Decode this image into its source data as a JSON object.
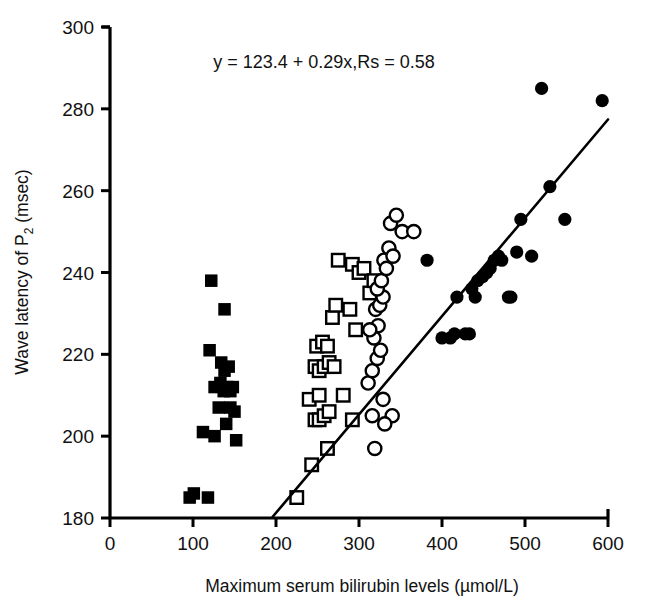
{
  "chart_data": {
    "type": "scatter",
    "title": "",
    "xlabel": "Maximum serum bilirubin levels (µmol/L)",
    "ylabel": "Wave latency of P₂ (msec)",
    "ylabel_main": "Wave latency of P",
    "ylabel_sub": "2",
    "ylabel_tail": " (msec)",
    "xlim": [
      0,
      600
    ],
    "ylim": [
      180,
      300
    ],
    "xticks": [
      0,
      100,
      200,
      300,
      400,
      500,
      600
    ],
    "yticks": [
      180,
      200,
      220,
      240,
      260,
      280,
      300
    ],
    "grid": false,
    "legend": "none",
    "annotation": "y = 123.4 + 0.29x,Rs = 0.58",
    "regression": {
      "intercept": 123.4,
      "slope": 0.29,
      "rs": 0.58,
      "x_start": 196,
      "y_start": 180.3,
      "x_end": 600,
      "y_end": 277.4
    },
    "series": [
      {
        "name": "filled-square",
        "marker": "filled-square",
        "color": "#000000",
        "points": [
          [
            96,
            185
          ],
          [
            101,
            186
          ],
          [
            118,
            185
          ],
          [
            112,
            201
          ],
          [
            126,
            200
          ],
          [
            140,
            203
          ],
          [
            152,
            199
          ],
          [
            126,
            212
          ],
          [
            133,
            213
          ],
          [
            137,
            211
          ],
          [
            141,
            212
          ],
          [
            145,
            211
          ],
          [
            148,
            212
          ],
          [
            120,
            221
          ],
          [
            134,
            218
          ],
          [
            138,
            216
          ],
          [
            143,
            217
          ],
          [
            131,
            207
          ],
          [
            145,
            207
          ],
          [
            150,
            206
          ],
          [
            138,
            231
          ],
          [
            122,
            238
          ]
        ]
      },
      {
        "name": "open-square",
        "marker": "open-square",
        "color": "#000000",
        "points": [
          [
            225,
            185
          ],
          [
            243,
            193
          ],
          [
            262,
            197
          ],
          [
            247,
            204
          ],
          [
            252,
            204
          ],
          [
            258,
            205
          ],
          [
            264,
            206
          ],
          [
            240,
            209
          ],
          [
            252,
            210
          ],
          [
            247,
            217
          ],
          [
            252,
            216
          ],
          [
            258,
            217
          ],
          [
            264,
            218
          ],
          [
            270,
            217
          ],
          [
            249,
            222
          ],
          [
            256,
            223
          ],
          [
            262,
            222
          ],
          [
            281,
            210
          ],
          [
            292,
            204
          ],
          [
            289,
            231
          ],
          [
            296,
            226
          ],
          [
            275,
            243
          ],
          [
            292,
            242
          ],
          [
            300,
            240
          ],
          [
            306,
            241
          ],
          [
            313,
            235
          ],
          [
            318,
            238
          ],
          [
            268,
            229
          ],
          [
            272,
            232
          ]
        ]
      },
      {
        "name": "open-circle",
        "marker": "open-circle",
        "color": "#000000",
        "points": [
          [
            316,
            205
          ],
          [
            329,
            209
          ],
          [
            340,
            205
          ],
          [
            311,
            213
          ],
          [
            316,
            216
          ],
          [
            322,
            219
          ],
          [
            326,
            221
          ],
          [
            318,
            224
          ],
          [
            323,
            227
          ],
          [
            313,
            226
          ],
          [
            320,
            231
          ],
          [
            325,
            232
          ],
          [
            329,
            234
          ],
          [
            322,
            236
          ],
          [
            327,
            238
          ],
          [
            330,
            243
          ],
          [
            333,
            241
          ],
          [
            336,
            246
          ],
          [
            341,
            244
          ],
          [
            352,
            250
          ],
          [
            366,
            250
          ],
          [
            338,
            252
          ],
          [
            345,
            254
          ],
          [
            319,
            197
          ],
          [
            331,
            203
          ]
        ]
      },
      {
        "name": "filled-circle",
        "marker": "filled-circle",
        "color": "#000000",
        "points": [
          [
            400,
            224
          ],
          [
            410,
            224
          ],
          [
            415,
            225
          ],
          [
            428,
            225
          ],
          [
            433,
            225
          ],
          [
            418,
            234
          ],
          [
            436,
            236
          ],
          [
            440,
            234
          ],
          [
            443,
            238
          ],
          [
            449,
            239
          ],
          [
            454,
            240
          ],
          [
            458,
            241
          ],
          [
            463,
            243
          ],
          [
            468,
            244
          ],
          [
            472,
            243
          ],
          [
            480,
            234
          ],
          [
            483,
            234
          ],
          [
            490,
            245
          ],
          [
            495,
            253
          ],
          [
            508,
            244
          ],
          [
            520,
            285
          ],
          [
            530,
            261
          ],
          [
            548,
            253
          ],
          [
            593,
            282
          ],
          [
            382,
            243
          ]
        ]
      }
    ]
  }
}
